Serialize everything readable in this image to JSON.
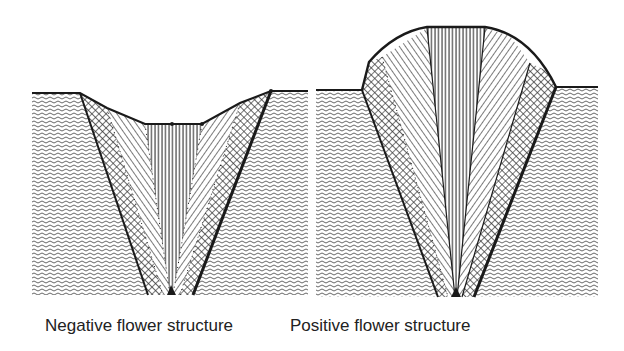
{
  "figure": {
    "panels": [
      {
        "id": "negative",
        "caption": "Negative flower structure"
      },
      {
        "id": "positive",
        "caption": "Positive flower structure"
      }
    ],
    "legend_patterns": {
      "substrate": "wavy-lines",
      "outer_zone": "cross-hatch",
      "middle_zone": "diagonal-hatch",
      "core_zone": "vertical-lines"
    },
    "colors": {
      "line": "#1a1a1a",
      "background": "#ffffff",
      "hatch": "#555555"
    }
  }
}
